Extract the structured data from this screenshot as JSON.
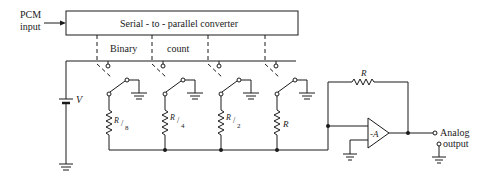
{
  "diagram": {
    "input_label_line1": "PCM",
    "input_label_line2": "input",
    "converter_label": "Serial - to - parallel converter",
    "binary_label": "Binary",
    "count_label": "count",
    "source_label": "V",
    "resistors": [
      {
        "label": "R",
        "sub": "8"
      },
      {
        "label": "R",
        "sub": "4"
      },
      {
        "label": "R",
        "sub": "2"
      },
      {
        "label": "R",
        "sub": ""
      }
    ],
    "feedback_resistor_label": "R",
    "opamp_label": "-A",
    "output_label_line1": "Analog",
    "output_label_line2": "output"
  }
}
